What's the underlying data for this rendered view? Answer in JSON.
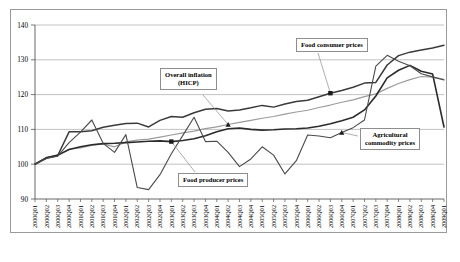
{
  "chart_data": {
    "type": "line",
    "title": "",
    "xlabel": "",
    "ylabel": "",
    "ylim": [
      90,
      140
    ],
    "ytick_step": 10,
    "yticks": [
      90,
      100,
      110,
      120,
      130,
      140
    ],
    "grid": true,
    "legend_position": "callout-annotations",
    "index_base": "2000Q1 = 100",
    "categories": [
      "2000Q01",
      "2000Q02",
      "2000Q03",
      "2000Q04",
      "2001Q01",
      "2001Q02",
      "2001Q03",
      "2001Q04",
      "2002Q01",
      "2002Q02",
      "2002Q03",
      "2002Q04",
      "2003Q01",
      "2003Q02",
      "2003Q03",
      "2003Q04",
      "2004Q01",
      "2004Q02",
      "2004Q03",
      "2004Q04",
      "2005Q01",
      "2005Q02",
      "2005Q03",
      "2005Q04",
      "2006Q01",
      "2006Q02",
      "2006Q03",
      "2006Q04",
      "2007Q01",
      "2007Q02",
      "2007Q03",
      "2007Q04",
      "2008Q01",
      "2008Q02",
      "2008Q03",
      "2008Q04",
      "2009Q01"
    ],
    "series": [
      {
        "name": "Food consumer prices",
        "color": "#3a3a3a",
        "width": 1.5,
        "values": [
          100.0,
          101.9,
          102.5,
          109.3,
          109.3,
          109.6,
          110.6,
          111.2,
          111.7,
          111.8,
          110.7,
          112.6,
          113.7,
          113.5,
          114.8,
          115.8,
          116.0,
          115.3,
          115.6,
          116.2,
          116.9,
          116.4,
          117.3,
          118.0,
          118.4,
          119.4,
          120.4,
          121.2,
          122.1,
          123.3,
          123.5,
          128.5,
          131.2,
          132.2,
          132.8,
          133.4,
          134.2
        ]
      },
      {
        "name": "Overall inflation (HICP)",
        "color": "#9b9b9b",
        "width": 1.2,
        "values": [
          100.0,
          101.6,
          102.4,
          104.3,
          104.7,
          105.4,
          105.8,
          105.0,
          106.4,
          106.9,
          107.2,
          107.8,
          108.4,
          109.0,
          109.5,
          110.2,
          110.7,
          111.4,
          112.0,
          112.6,
          113.2,
          113.7,
          114.4,
          115.0,
          115.5,
          116.3,
          117.0,
          117.8,
          118.5,
          119.4,
          120.2,
          121.8,
          123.2,
          124.3,
          125.2,
          125.0,
          124.4
        ]
      },
      {
        "name": "Food producer prices",
        "color": "#2b2b2b",
        "width": 1.6,
        "values": [
          100.0,
          101.8,
          102.6,
          104.2,
          105.0,
          105.6,
          105.9,
          106.0,
          106.2,
          106.4,
          106.6,
          106.7,
          106.5,
          106.8,
          107.3,
          108.2,
          109.3,
          110.2,
          110.4,
          110.0,
          109.8,
          109.9,
          110.1,
          110.2,
          110.4,
          110.9,
          111.6,
          112.5,
          113.5,
          115.6,
          119.6,
          124.8,
          127.0,
          128.4,
          126.7,
          125.9,
          110.7
        ]
      },
      {
        "name": "Agricultural commodity prices",
        "color": "#4a4a4a",
        "width": 1.1,
        "values": [
          100.0,
          101.7,
          102.3,
          106.2,
          109.2,
          112.7,
          106.0,
          103.4,
          108.5,
          93.3,
          92.7,
          97.0,
          103.0,
          108.2,
          113.5,
          106.5,
          106.6,
          103.4,
          99.3,
          101.5,
          105.0,
          102.6,
          97.2,
          101.0,
          108.4,
          108.1,
          107.6,
          109.1,
          110.5,
          112.7,
          128.2,
          131.3,
          129.6,
          128.3,
          126.0,
          125.1,
          124.2
        ]
      }
    ],
    "annotations": [
      {
        "name": "food-consumer-prices",
        "label": "Food consumer prices"
      },
      {
        "name": "overall-inflation",
        "label_line1": "Overall inflation",
        "label_line2": "(HICP)"
      },
      {
        "name": "food-producer-prices",
        "label": "Food producer prices"
      },
      {
        "name": "agricultural-commodity-prices",
        "label_line1": "Agricultural",
        "label_line2": "commodity prices"
      }
    ]
  }
}
